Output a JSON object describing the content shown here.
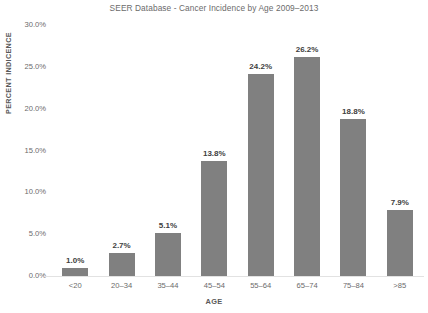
{
  "chart_data": {
    "type": "bar",
    "title": "SEER Database - Cancer Incidence by Age 2009–2013",
    "xlabel": "AGE",
    "ylabel": "PERCENT INDICENCE",
    "categories": [
      "<20",
      "20–34",
      "35–44",
      "45–54",
      "55–64",
      "65–74",
      "75–84",
      ">85"
    ],
    "values": [
      1.0,
      2.7,
      5.1,
      13.8,
      24.2,
      26.2,
      18.8,
      7.9
    ],
    "data_labels": [
      "1.0%",
      "2.7%",
      "5.1%",
      "13.8%",
      "24.2%",
      "26.2%",
      "18.8%",
      "7.9%"
    ],
    "ylim": [
      0,
      30
    ],
    "ytick_values": [
      30.0,
      25.0,
      20.0,
      15.0,
      10.0,
      5.0,
      0.0
    ],
    "ytick_labels": [
      "30.0%",
      "25.0%",
      "20.0%",
      "15.0%",
      "10.0%",
      "5.0%",
      "0.0%"
    ],
    "grid": false,
    "legend": false,
    "bar_color": "#808080",
    "background_color": "#ffffff",
    "title_color": "#6b6b6b",
    "label_color": "#404040",
    "axis_text_color": "#6b6b6b"
  }
}
